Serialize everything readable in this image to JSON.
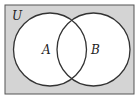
{
  "diagram": {
    "type": "venn",
    "universe_label": "U",
    "sets": [
      {
        "label": "A"
      },
      {
        "label": "B"
      }
    ],
    "colors": {
      "universe_fill": "#d4d4d4",
      "circle_fill": "#ffffff",
      "stroke": "#333333"
    }
  }
}
